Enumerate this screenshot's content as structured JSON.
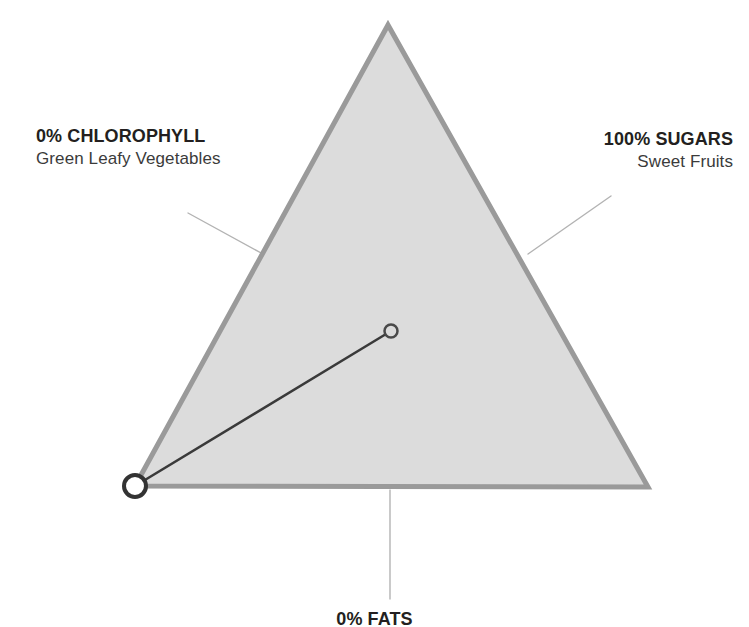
{
  "diagram": {
    "type": "ternary-triangle-plot",
    "background_color": "#ffffff",
    "triangle": {
      "fill_color": "#dcdcdc",
      "stroke_color": "#9a9a9a",
      "stroke_width": 5,
      "apex_top": [
        388,
        25
      ],
      "vertex_bottom_left": [
        135,
        486
      ],
      "vertex_bottom_right": [
        648,
        487
      ]
    },
    "data_line": {
      "color": "#3a3a3a",
      "width": 2.5,
      "from": [
        135,
        486
      ],
      "to": [
        391,
        331
      ]
    },
    "markers": [
      {
        "name": "origin-marker",
        "cx": 135,
        "cy": 486,
        "r": 11,
        "stroke_color": "#333333",
        "fill_color": "#ffffff",
        "stroke_width": 4
      },
      {
        "name": "endpoint-marker",
        "cx": 391,
        "cy": 331,
        "r": 6.5,
        "stroke_color": "#4a4a4a",
        "fill_color": "#dcdcdc",
        "stroke_width": 2.5
      }
    ],
    "leader_lines": {
      "color": "#b3b3b3",
      "width": 1.4,
      "lines": [
        {
          "name": "leader-line-chlorophyll",
          "x1": 188,
          "y1": 213,
          "x2": 263,
          "y2": 254
        },
        {
          "name": "leader-line-sugars",
          "x1": 611,
          "y1": 196,
          "x2": 528,
          "y2": 254
        },
        {
          "name": "leader-line-fats",
          "x1": 390,
          "y1": 490,
          "x2": 390,
          "y2": 599
        }
      ]
    }
  },
  "labels": {
    "chlorophyll": {
      "title": "0% CHLOROPHYLL",
      "subtitle": "Green Leafy Vegetables"
    },
    "sugars": {
      "title": "100% SUGARS",
      "subtitle": "Sweet Fruits"
    },
    "fats": {
      "title": "0% FATS"
    }
  }
}
